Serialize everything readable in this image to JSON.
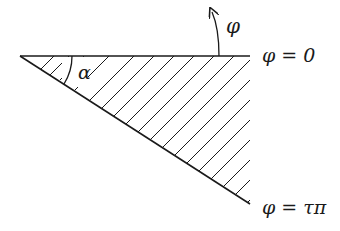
{
  "diagram": {
    "type": "wedge-region",
    "labels": {
      "angle": "α",
      "direction": "φ",
      "top_boundary": "φ = 0",
      "bottom_boundary": "φ = τπ"
    },
    "colors": {
      "stroke": "#1a1a1a",
      "background": "#ffffff"
    }
  }
}
